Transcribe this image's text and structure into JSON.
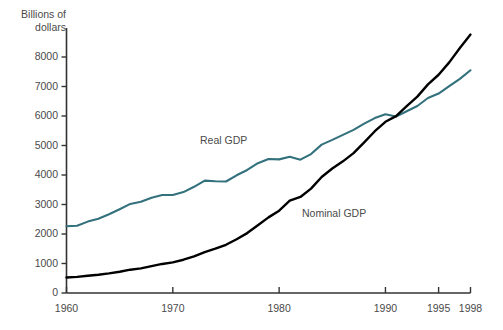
{
  "chart_data": {
    "type": "line",
    "title": "",
    "xlabel": "",
    "ylabel": "Billions of\ndollars",
    "ylabel_line1": "Billions of",
    "ylabel_line2": "dollars",
    "xlim": [
      1960,
      1998
    ],
    "ylim": [
      0,
      8400
    ],
    "grid": false,
    "legend_position": "inline-annotation",
    "x_tick_labels": [
      "1960",
      "1970",
      "1980",
      "1990",
      "1995",
      "1998"
    ],
    "x_ticks": [
      1960,
      1970,
      1980,
      1990,
      1995,
      1998
    ],
    "y_tick_labels": [
      "0",
      "1000",
      "2000",
      "3000",
      "4000",
      "5000",
      "6000",
      "7000",
      "8000"
    ],
    "y_ticks": [
      0,
      1000,
      2000,
      3000,
      4000,
      5000,
      6000,
      7000,
      8000
    ],
    "x": [
      1960,
      1961,
      1962,
      1963,
      1964,
      1965,
      1966,
      1967,
      1968,
      1969,
      1970,
      1971,
      1972,
      1973,
      1974,
      1975,
      1976,
      1977,
      1978,
      1979,
      1980,
      1981,
      1982,
      1983,
      1984,
      1985,
      1986,
      1987,
      1988,
      1989,
      1990,
      1991,
      1992,
      1993,
      1994,
      1995,
      1996,
      1997,
      1998
    ],
    "series": [
      {
        "name": "Real GDP",
        "color": "#33717d",
        "values": [
          2263,
          2280,
          2420,
          2520,
          2670,
          2840,
          3020,
          3090,
          3230,
          3320,
          3320,
          3420,
          3600,
          3810,
          3790,
          3780,
          3990,
          4170,
          4400,
          4540,
          4530,
          4620,
          4520,
          4710,
          5030,
          5190,
          5360,
          5530,
          5740,
          5930,
          6060,
          5980,
          6160,
          6340,
          6610,
          6760,
          7010,
          7260,
          7550
        ]
      },
      {
        "name": "Nominal GDP",
        "color": "#000000",
        "values": [
          526,
          545,
          586,
          619,
          664,
          720,
          790,
          834,
          911,
          985,
          1039,
          1128,
          1241,
          1386,
          1501,
          1635,
          1824,
          2031,
          2295,
          2563,
          2790,
          3128,
          3255,
          3537,
          3933,
          4220,
          4463,
          4740,
          5104,
          5484,
          5803,
          5996,
          6338,
          6657,
          7072,
          7398,
          7817,
          8304,
          8759
        ]
      }
    ],
    "annotations": [
      {
        "text": "Real GDP",
        "x_pos_px": 200,
        "y_pos_px": 135
      },
      {
        "text": "Nominal GDP",
        "x_pos_px": 302,
        "y_pos_px": 207
      }
    ]
  },
  "axis": {
    "y_title_line1": "Billions of",
    "y_title_line2": "dollars"
  },
  "labels": {
    "real_gdp": "Real GDP",
    "nominal_gdp": "Nominal GDP"
  },
  "y_ticks_display": [
    {
      "label": "8000"
    },
    {
      "label": "7000"
    },
    {
      "label": "6000"
    },
    {
      "label": "5000"
    },
    {
      "label": "4000"
    },
    {
      "label": "3000"
    },
    {
      "label": "2000"
    },
    {
      "label": "1000"
    },
    {
      "label": "0"
    }
  ],
  "x_ticks_display": [
    {
      "label": "1960"
    },
    {
      "label": "1970"
    },
    {
      "label": "1980"
    },
    {
      "label": "1990"
    },
    {
      "label": "1995"
    },
    {
      "label": "1998"
    }
  ]
}
